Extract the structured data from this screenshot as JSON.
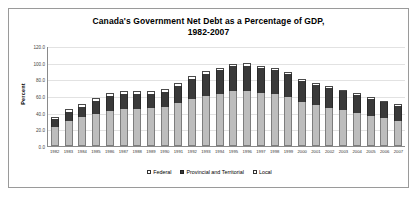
{
  "chart_data": {
    "type": "bar",
    "stacked": true,
    "title": "Canada's Government Net Debt as a Percentage of GDP,",
    "title_line2": "1982-2007",
    "xlabel": "",
    "ylabel": "Percent",
    "ylim": [
      0,
      120
    ],
    "yticks": [
      "0.0",
      "20.0",
      "40.0",
      "60.0",
      "80.0",
      "100.0",
      "120.0"
    ],
    "grid": true,
    "legend_position": "bottom",
    "categories": [
      "1982",
      "1983",
      "1984",
      "1985",
      "1986",
      "1987",
      "1988",
      "1989",
      "1990",
      "1991",
      "1992",
      "1993",
      "1994",
      "1995",
      "1996",
      "1997",
      "1998",
      "1999",
      "2000",
      "2001",
      "2002",
      "2003",
      "2004",
      "2005",
      "2006",
      "2007"
    ],
    "series": [
      {
        "name": "Federal",
        "color": "#bdbdbd",
        "values": [
          23.0,
          29.5,
          34.5,
          39.0,
          42.5,
          44.5,
          45.0,
          45.5,
          47.0,
          51.5,
          56.5,
          60.5,
          62.5,
          65.5,
          66.0,
          64.0,
          62.0,
          58.5,
          53.0,
          49.0,
          46.0,
          43.0,
          40.0,
          36.5,
          33.5,
          30.5
        ]
      },
      {
        "name": "Provincial and Territorial",
        "color": "#3a3a3a",
        "values": [
          9.0,
          11.0,
          12.0,
          15.5,
          18.0,
          18.5,
          18.0,
          17.5,
          18.0,
          21.0,
          24.0,
          26.0,
          28.5,
          30.0,
          30.5,
          29.5,
          29.0,
          27.5,
          25.5,
          24.5,
          23.5,
          22.5,
          21.5,
          20.5,
          19.0,
          18.0
        ]
      },
      {
        "name": "Local",
        "color": "#ffffff",
        "values": [
          3.0,
          3.5,
          3.5,
          3.5,
          3.5,
          3.5,
          3.0,
          3.0,
          3.0,
          3.0,
          3.0,
          3.0,
          3.0,
          3.0,
          3.0,
          3.0,
          2.5,
          2.5,
          2.5,
          2.5,
          2.0,
          2.0,
          2.0,
          2.0,
          2.0,
          2.0
        ]
      }
    ],
    "totals": [
      35.0,
      44.0,
      50.0,
      58.0,
      64.0,
      66.5,
      66.0,
      66.0,
      68.0,
      75.5,
      83.5,
      89.5,
      94.0,
      98.5,
      99.5,
      96.5,
      93.5,
      88.5,
      81.0,
      76.0,
      71.5,
      67.5,
      63.5,
      59.0,
      54.5,
      50.5
    ]
  }
}
